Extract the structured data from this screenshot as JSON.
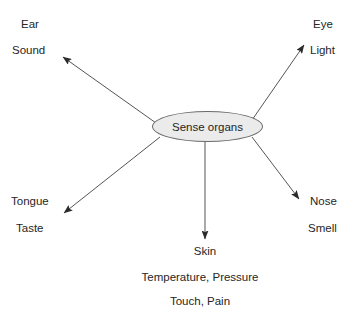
{
  "diagram": {
    "type": "spider-map",
    "center": {
      "label": "Sense organs",
      "shape": "ellipse",
      "fill_color": "#ebebeb",
      "border_color": "#6b6b6b"
    },
    "line_color": "#555555",
    "text_color": "#262626",
    "background_color": "#ffffff",
    "branches": [
      {
        "id": "ear",
        "organ": "Ear",
        "stimulus": "Sound",
        "direction": "upper-left"
      },
      {
        "id": "eye",
        "organ": "Eye",
        "stimulus": "Light",
        "direction": "upper-right"
      },
      {
        "id": "tongue",
        "organ": "Tongue",
        "stimulus": "Taste",
        "direction": "lower-left"
      },
      {
        "id": "nose",
        "organ": "Nose",
        "stimulus": "Smell",
        "direction": "lower-right"
      },
      {
        "id": "skin",
        "organ": "Skin",
        "stimulus": "Temperature, Pressure",
        "stimulus_extra": "Touch, Pain",
        "direction": "down"
      }
    ]
  }
}
